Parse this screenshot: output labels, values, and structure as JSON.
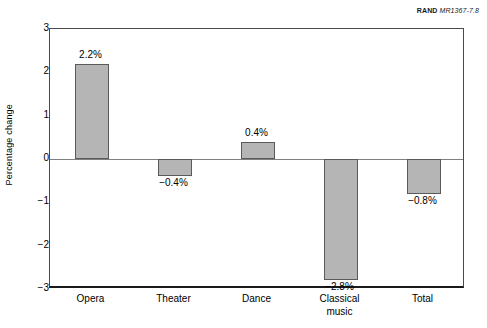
{
  "source_note": {
    "mark": "RAND",
    "document": "MR1367-7.8"
  },
  "chart_data": {
    "type": "bar",
    "title": "",
    "subtitle": "",
    "xlabel": "",
    "ylabel": "Percentage change",
    "ylim": [
      -3,
      3
    ],
    "ytick_step": 1,
    "grid": false,
    "legend": "none",
    "value_label_suffix": "%",
    "bar_color": "#b5b5b5",
    "bar_border_color": "#5a5a5a",
    "axis_color": "#1a1a1a",
    "zero_line_color": "#808080",
    "categories": [
      "Opera",
      "Theater",
      "Dance",
      "Classical music",
      "Total"
    ],
    "category_lines": [
      [
        "Opera"
      ],
      [
        "Theater"
      ],
      [
        "Dance"
      ],
      [
        "Classical",
        "music"
      ],
      [
        "Total"
      ]
    ],
    "values": [
      2.2,
      -0.4,
      0.4,
      -2.8,
      -0.8
    ],
    "value_labels": [
      "2.2%",
      "−0.4%",
      "0.4%",
      "−2.8%",
      "−0.8%"
    ],
    "ytick_labels": [
      "3",
      "2",
      "1",
      "0",
      "−1",
      "−2",
      "−3"
    ],
    "ytick_values": [
      3,
      2,
      1,
      0,
      -1,
      -2,
      -3
    ]
  }
}
